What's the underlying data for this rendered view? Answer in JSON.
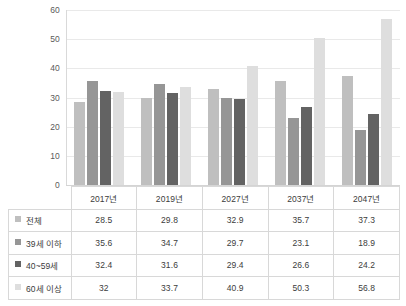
{
  "chart_data": {
    "type": "bar",
    "title": "",
    "xlabel": "",
    "ylabel": "",
    "ylim": [
      0,
      60
    ],
    "yticks": [
      0,
      10,
      20,
      30,
      40,
      50,
      60
    ],
    "grid": true,
    "legend_position": "table-left",
    "categories": [
      "2017년",
      "2019년",
      "2027년",
      "2037년",
      "2047년"
    ],
    "series": [
      {
        "name": "전체",
        "color": "#bfbfbf",
        "values": [
          28.5,
          29.8,
          32.9,
          35.7,
          37.3
        ],
        "labels": [
          "28.5",
          "29.8",
          "32.9",
          "35.7",
          "37.3"
        ]
      },
      {
        "name": "39세 이하",
        "color": "#969696",
        "values": [
          35.6,
          34.7,
          29.7,
          23.1,
          18.9
        ],
        "labels": [
          "35.6",
          "34.7",
          "29.7",
          "23.1",
          "18.9"
        ]
      },
      {
        "name": "40~59세",
        "color": "#636363",
        "values": [
          32.4,
          31.6,
          29.4,
          26.6,
          24.2
        ],
        "labels": [
          "32.4",
          "31.6",
          "29.4",
          "26.6",
          "24.2"
        ]
      },
      {
        "name": "60세 이상",
        "color": "#dedede",
        "values": [
          32.0,
          33.7,
          40.9,
          50.3,
          56.8
        ],
        "labels": [
          "32",
          "33.7",
          "40.9",
          "50.3",
          "56.8"
        ]
      }
    ]
  }
}
